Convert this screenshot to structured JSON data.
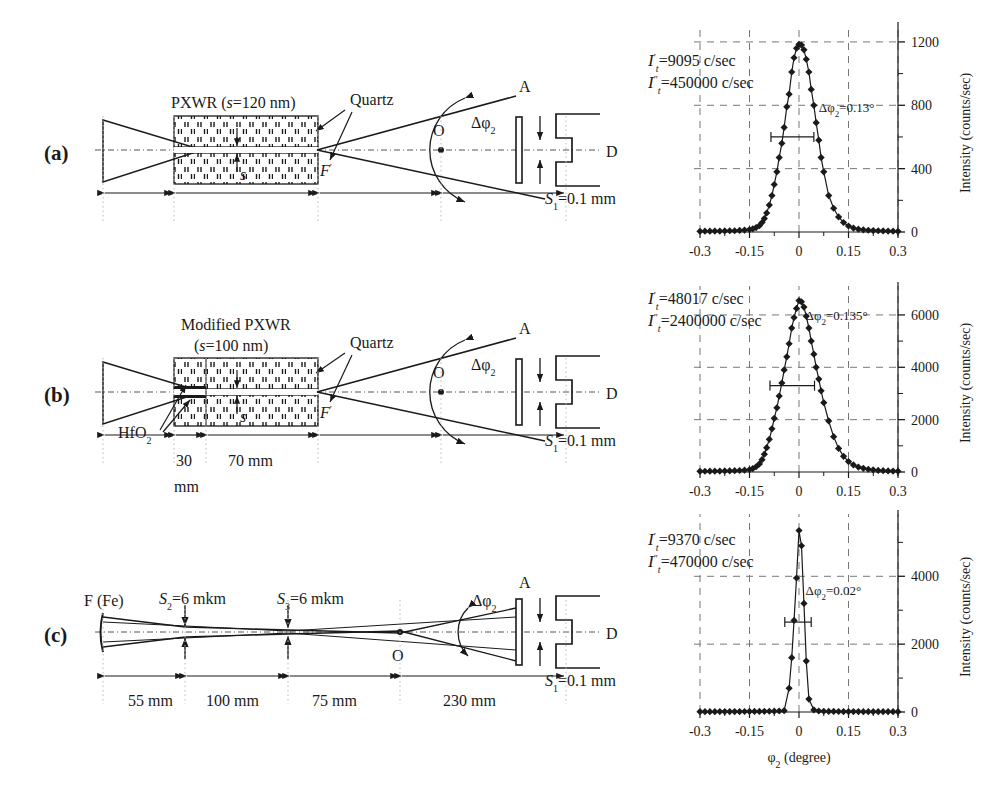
{
  "figure": {
    "panels": [
      {
        "id": "a",
        "label": "(a)",
        "device_title": "PXWR (s=120 nm)",
        "device_name": "PXWR",
        "gap_label": "(s=120 nm)",
        "material_label": "Quartz",
        "gap_symbol": "s",
        "focus_label": "F'",
        "point_O": "O",
        "point_A": "A",
        "angle_label": "Δφ",
        "angle_sub": "2",
        "detector_label": "D",
        "slit_label": "S₁=0.1 mm",
        "slit_symbol": "S",
        "slit_sub": "1",
        "slit_value": "=0.1 mm",
        "dimensions": []
      },
      {
        "id": "b",
        "label": "(b)",
        "device_title": "Modified PXWR",
        "gap_label": "(s=100 nm)",
        "material_label": "Quartz",
        "coating_label": "HfO₂",
        "coating_symbol": "HfO",
        "coating_sub": "2",
        "gap_symbol": "s",
        "focus_label": "F'",
        "point_O": "O",
        "point_A": "A",
        "angle_label": "Δφ",
        "angle_sub": "2",
        "detector_label": "D",
        "slit_label": "S₁=0.1 mm",
        "slit_symbol": "S",
        "slit_sub": "1",
        "slit_value": "=0.1 mm",
        "dimensions": [
          "30",
          "mm",
          "70 mm"
        ]
      },
      {
        "id": "c",
        "label": "(c)",
        "source_label": "F (Fe)",
        "slit2_symbol": "S",
        "slit2_sub": "2",
        "slit2_value": "=6 mkm",
        "slit2_label": "S₂=6 mkm",
        "slit3_symbol": "S",
        "slit3_sub": "3",
        "slit3_value": "=6 mkm",
        "slit3_label": "S₃=6 mkm",
        "point_O": "O",
        "point_A": "A",
        "angle_label": "Δφ",
        "angle_sub": "2",
        "detector_label": "D",
        "slit_label": "S₁=0.1 mm",
        "slit_symbol": "S",
        "slit_sub": "1",
        "slit_value": "=0.1 mm",
        "dimensions": [
          "55 mm",
          "100 mm",
          "75 mm",
          "230 mm"
        ]
      }
    ]
  },
  "chart_data": [
    {
      "type": "line",
      "panel": "a",
      "title": "",
      "xlabel": "",
      "ylabel": "Intensity (counts/sec)",
      "xticks": [
        "-0.3",
        "-0.15",
        "0",
        "0.15",
        "0.3"
      ],
      "xtickvals": [
        -0.3,
        -0.15,
        0,
        0.15,
        0.3
      ],
      "yticks": [
        "0",
        "400",
        "800",
        "1200"
      ],
      "ytickvals": [
        0,
        400,
        800,
        1200
      ],
      "xlim": [
        -0.3,
        0.3
      ],
      "ylim": [
        0,
        1250
      ],
      "grid": true,
      "legend": "none",
      "annotations": [
        {
          "name": "It-single-prime",
          "symbol": "I",
          "primes": "′",
          "sub": "t",
          "text": "=9095 c/sec"
        },
        {
          "name": "It-double-prime",
          "symbol": "I",
          "primes": "″",
          "sub": "t",
          "text": "=450000 c/sec"
        },
        {
          "name": "fwhm",
          "symbol": "Δφ",
          "sub": "2",
          "text": "=0.13°"
        }
      ],
      "fwhm_bar": {
        "y": 600,
        "x0": -0.085,
        "x1": 0.045
      },
      "x": [
        -0.3,
        -0.285,
        -0.27,
        -0.255,
        -0.24,
        -0.225,
        -0.21,
        -0.195,
        -0.18,
        -0.165,
        -0.15,
        -0.14,
        -0.13,
        -0.12,
        -0.112,
        -0.105,
        -0.098,
        -0.09,
        -0.082,
        -0.075,
        -0.067,
        -0.06,
        -0.052,
        -0.045,
        -0.037,
        -0.03,
        -0.022,
        -0.015,
        -0.0075,
        0,
        0.0075,
        0.015,
        0.022,
        0.03,
        0.037,
        0.045,
        0.052,
        0.06,
        0.067,
        0.075,
        0.09,
        0.105,
        0.12,
        0.135,
        0.15,
        0.165,
        0.18,
        0.195,
        0.21,
        0.225,
        0.24,
        0.255,
        0.27,
        0.285,
        0.3
      ],
      "values": [
        4,
        5,
        5,
        6,
        6,
        7,
        8,
        8,
        10,
        12,
        15,
        20,
        28,
        40,
        60,
        85,
        120,
        170,
        230,
        300,
        380,
        470,
        560,
        660,
        790,
        870,
        1010,
        1100,
        1160,
        1185,
        1180,
        1150,
        1090,
        1010,
        900,
        800,
        690,
        580,
        470,
        380,
        230,
        150,
        95,
        60,
        38,
        25,
        18,
        14,
        11,
        9,
        8,
        7,
        6,
        5,
        4
      ]
    },
    {
      "type": "line",
      "panel": "b",
      "title": "",
      "xlabel": "",
      "ylabel": "Intensity (counts/sec)",
      "xticks": [
        "-0.3",
        "-0.15",
        "0",
        "0.15",
        "0.3"
      ],
      "xtickvals": [
        -0.3,
        -0.15,
        0,
        0.15,
        0.3
      ],
      "yticks": [
        "0",
        "2000",
        "4000",
        "6000"
      ],
      "ytickvals": [
        0,
        2000,
        4000,
        6000
      ],
      "xlim": [
        -0.3,
        0.3
      ],
      "ylim": [
        0,
        6800
      ],
      "grid": true,
      "legend": "none",
      "annotations": [
        {
          "name": "It-single-prime",
          "symbol": "I",
          "primes": "′",
          "sub": "t",
          "text": "=48017 c/sec"
        },
        {
          "name": "It-double-prime",
          "symbol": "I",
          "primes": "″",
          "sub": "t",
          "text": "=2400000 c/sec"
        },
        {
          "name": "fwhm",
          "symbol": "Δφ",
          "sub": "2",
          "text": "=0.135°"
        }
      ],
      "fwhm_bar": {
        "y": 3300,
        "x0": -0.088,
        "x1": 0.047
      },
      "x": [
        -0.3,
        -0.285,
        -0.27,
        -0.255,
        -0.24,
        -0.225,
        -0.21,
        -0.195,
        -0.18,
        -0.165,
        -0.15,
        -0.14,
        -0.13,
        -0.12,
        -0.112,
        -0.105,
        -0.098,
        -0.09,
        -0.082,
        -0.075,
        -0.067,
        -0.06,
        -0.052,
        -0.045,
        -0.037,
        -0.03,
        -0.022,
        -0.015,
        -0.0075,
        0,
        0.0075,
        0.015,
        0.022,
        0.03,
        0.037,
        0.045,
        0.052,
        0.06,
        0.067,
        0.075,
        0.09,
        0.105,
        0.12,
        0.135,
        0.15,
        0.165,
        0.18,
        0.195,
        0.21,
        0.225,
        0.24,
        0.255,
        0.27,
        0.285,
        0.3
      ],
      "values": [
        25,
        28,
        30,
        33,
        36,
        40,
        45,
        50,
        58,
        70,
        90,
        130,
        200,
        310,
        470,
        680,
        930,
        1250,
        1650,
        2050,
        2450,
        2900,
        3400,
        3900,
        4400,
        4900,
        5500,
        5900,
        6250,
        6550,
        6500,
        6300,
        5950,
        5500,
        5000,
        4500,
        4000,
        3550,
        3100,
        2650,
        1950,
        1350,
        900,
        600,
        400,
        270,
        190,
        140,
        105,
        80,
        62,
        50,
        42,
        36,
        30
      ]
    },
    {
      "type": "line",
      "panel": "c",
      "title": "",
      "xlabel": "φ₂ (degree)",
      "xlabel_symbol": "φ",
      "xlabel_sub": "2",
      "xlabel_rest": " (degree)",
      "ylabel": "Intensity (counts/sec)",
      "xticks": [
        "-0.3",
        "-0.15",
        "0",
        "0.15",
        "0.3"
      ],
      "xtickvals": [
        -0.3,
        -0.15,
        0,
        0.15,
        0.3
      ],
      "yticks": [
        "0",
        "2000",
        "4000"
      ],
      "ytickvals": [
        0,
        2000,
        4000
      ],
      "xlim": [
        -0.3,
        0.3
      ],
      "ylim": [
        0,
        5600
      ],
      "grid": true,
      "legend": "none",
      "annotations": [
        {
          "name": "It-single-prime",
          "symbol": "I",
          "primes": "′",
          "sub": "t",
          "text": "=9370 c/sec"
        },
        {
          "name": "It-double-prime",
          "symbol": "I",
          "primes": "″",
          "sub": "t",
          "text": "=470000 c/sec"
        },
        {
          "name": "fwhm",
          "symbol": "Δφ",
          "sub": "2",
          "text": "=0.02°"
        }
      ],
      "fwhm_bar": {
        "y": 2650,
        "x0": -0.043,
        "x1": 0.037
      },
      "x": [
        -0.3,
        -0.285,
        -0.27,
        -0.255,
        -0.24,
        -0.225,
        -0.21,
        -0.195,
        -0.18,
        -0.165,
        -0.15,
        -0.135,
        -0.12,
        -0.105,
        -0.09,
        -0.075,
        -0.06,
        -0.045,
        -0.03,
        -0.022,
        -0.015,
        -0.0075,
        0,
        0.0075,
        0.015,
        0.022,
        0.03,
        0.045,
        0.06,
        0.075,
        0.09,
        0.105,
        0.12,
        0.135,
        0.15,
        0.165,
        0.18,
        0.195,
        0.21,
        0.225,
        0.24,
        0.255,
        0.27,
        0.285,
        0.3
      ],
      "values": [
        10,
        10,
        11,
        11,
        12,
        12,
        13,
        13,
        14,
        15,
        16,
        17,
        18,
        20,
        22,
        25,
        30,
        40,
        700,
        1600,
        2700,
        3950,
        5350,
        4900,
        3200,
        1500,
        380,
        60,
        30,
        22,
        18,
        16,
        15,
        14,
        13,
        12,
        12,
        11,
        11,
        10,
        10,
        10,
        10,
        10,
        10
      ]
    }
  ]
}
